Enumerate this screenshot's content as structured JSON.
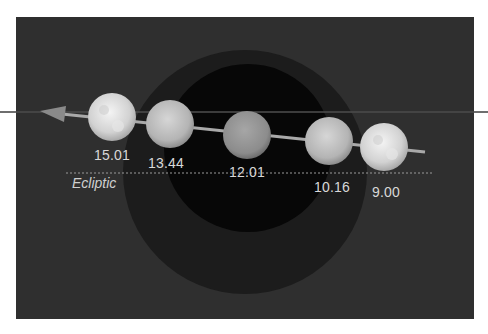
{
  "diagram": {
    "colors": {
      "background": "#2f2f2f",
      "penumbra": "#1c1c1c",
      "umbra": "#070707",
      "path_line": "#a9a9a9",
      "label_text": "#d8d8d8"
    },
    "ecliptic_label": "Ecliptic",
    "moons": [
      {
        "time": "15.01",
        "cx": 112,
        "cy": 117,
        "label_x": 112,
        "label_y": 147
      },
      {
        "time": "13.44",
        "cx": 170,
        "cy": 124,
        "label_x": 166,
        "label_y": 155
      },
      {
        "time": "12.01",
        "cx": 247,
        "cy": 135,
        "label_x": 247,
        "label_y": 164
      },
      {
        "time": "10.16",
        "cx": 329,
        "cy": 141,
        "label_x": 332,
        "label_y": 179
      },
      {
        "time": "9.00",
        "cx": 384,
        "cy": 147,
        "label_x": 386,
        "label_y": 184
      }
    ]
  }
}
